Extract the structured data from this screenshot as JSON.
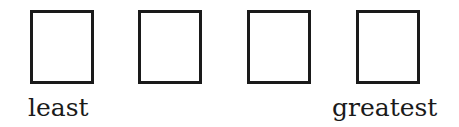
{
  "diagram": {
    "type": "ordering-boxes",
    "boxes": [
      {
        "position": 1,
        "value": ""
      },
      {
        "position": 2,
        "value": ""
      },
      {
        "position": 3,
        "value": ""
      },
      {
        "position": 4,
        "value": ""
      }
    ],
    "labels": {
      "left": "least",
      "right": "greatest"
    },
    "colors": {
      "border": "#1a1a1a",
      "background": "#ffffff",
      "text": "#1a1a1a"
    }
  }
}
